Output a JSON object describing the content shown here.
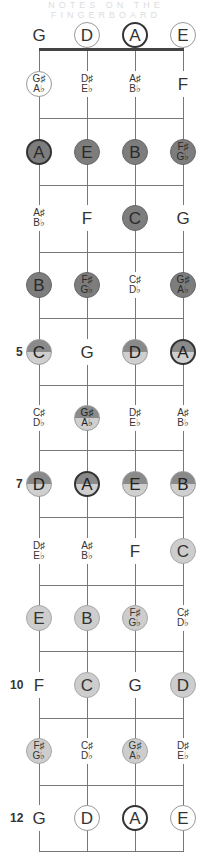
{
  "title": "NOTES ON THE FINGERBOARD",
  "colors": {
    "dark": "#7d7d7d",
    "split_top": "#8a8a8a",
    "split_bottom": "#cfcfcf",
    "light": "#cdcdcd",
    "line": "#777777",
    "nut": "#444444"
  },
  "strings": [
    "G",
    "D",
    "A",
    "E"
  ],
  "fret_numbers": {
    "5": "5",
    "7": "7",
    "10": "10",
    "12": "12"
  },
  "rows": [
    {
      "fret": 0,
      "notes": [
        {
          "t": "G",
          "s": "plain"
        },
        {
          "t": "D",
          "s": "outline"
        },
        {
          "t": "A",
          "s": "outline-bold"
        },
        {
          "t": "E",
          "s": "outline"
        }
      ]
    },
    {
      "fret": 1,
      "notes": [
        {
          "a": "G♯",
          "b": "A♭",
          "s": "outline"
        },
        {
          "a": "D♯",
          "b": "E♭",
          "s": "plain"
        },
        {
          "a": "A♯",
          "b": "B♭",
          "s": "plain"
        },
        {
          "t": "F",
          "s": "plain"
        }
      ]
    },
    {
      "fret": 2,
      "notes": [
        {
          "t": "A",
          "s": "dark bold"
        },
        {
          "t": "E",
          "s": "dark"
        },
        {
          "t": "B",
          "s": "dark"
        },
        {
          "a": "F♯",
          "b": "G♭",
          "s": "dark"
        }
      ]
    },
    {
      "fret": 3,
      "notes": [
        {
          "a": "A♯",
          "b": "B♭",
          "s": "plain"
        },
        {
          "t": "F",
          "s": "plain"
        },
        {
          "t": "C",
          "s": "dark"
        },
        {
          "t": "G",
          "s": "plain"
        }
      ]
    },
    {
      "fret": 4,
      "notes": [
        {
          "t": "B",
          "s": "dark"
        },
        {
          "a": "F♯",
          "b": "G♭",
          "s": "dark"
        },
        {
          "a": "C♯",
          "b": "D♭",
          "s": "plain"
        },
        {
          "a": "G♯",
          "b": "A♭",
          "s": "dark"
        }
      ]
    },
    {
      "fret": 5,
      "notes": [
        {
          "t": "C",
          "s": "split"
        },
        {
          "t": "G",
          "s": "plain"
        },
        {
          "t": "D",
          "s": "split"
        },
        {
          "t": "A",
          "s": "split bold"
        }
      ]
    },
    {
      "fret": 6,
      "notes": [
        {
          "a": "C♯",
          "b": "D♭",
          "s": "plain"
        },
        {
          "a": "G♯",
          "b": "A♭",
          "s": "split"
        },
        {
          "a": "D♯",
          "b": "E♭",
          "s": "plain"
        },
        {
          "a": "A♯",
          "b": "B♭",
          "s": "plain"
        }
      ]
    },
    {
      "fret": 7,
      "notes": [
        {
          "t": "D",
          "s": "split"
        },
        {
          "t": "A",
          "s": "split bold"
        },
        {
          "t": "E",
          "s": "split"
        },
        {
          "t": "B",
          "s": "split"
        }
      ]
    },
    {
      "fret": 8,
      "notes": [
        {
          "a": "D♯",
          "b": "E♭",
          "s": "plain"
        },
        {
          "a": "A♯",
          "b": "B♭",
          "s": "plain"
        },
        {
          "t": "F",
          "s": "plain"
        },
        {
          "t": "C",
          "s": "light"
        }
      ]
    },
    {
      "fret": 9,
      "notes": [
        {
          "t": "E",
          "s": "light"
        },
        {
          "t": "B",
          "s": "light"
        },
        {
          "a": "F♯",
          "b": "G♭",
          "s": "light"
        },
        {
          "a": "C♯",
          "b": "D♭",
          "s": "plain"
        }
      ]
    },
    {
      "fret": 10,
      "notes": [
        {
          "t": "F",
          "s": "plain"
        },
        {
          "t": "C",
          "s": "light"
        },
        {
          "t": "G",
          "s": "plain"
        },
        {
          "t": "D",
          "s": "light"
        }
      ]
    },
    {
      "fret": 11,
      "notes": [
        {
          "a": "F♯",
          "b": "G♭",
          "s": "light"
        },
        {
          "a": "C♯",
          "b": "D♭",
          "s": "plain"
        },
        {
          "a": "G♯",
          "b": "A♭",
          "s": "light"
        },
        {
          "a": "D♯",
          "b": "E♭",
          "s": "plain"
        }
      ]
    },
    {
      "fret": 12,
      "notes": [
        {
          "t": "G",
          "s": "plain"
        },
        {
          "t": "D",
          "s": "outline"
        },
        {
          "t": "A",
          "s": "outline-bold"
        },
        {
          "t": "E",
          "s": "outline"
        }
      ]
    }
  ]
}
